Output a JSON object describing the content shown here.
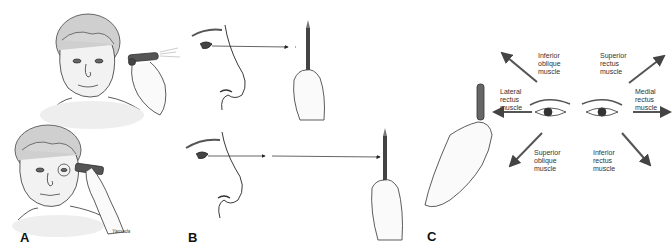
{
  "figure": {
    "panels": [
      {
        "id": "A",
        "letter": "A",
        "description": "Elderly woman with penlight held to eye (top) and occluder/penlight at eye with glasses (bottom)"
      },
      {
        "id": "B",
        "letter": "B",
        "description": "Profile views of face with sight-line arrows to a pencil held near (top) and far (bottom)"
      },
      {
        "id": "C",
        "letter": "C",
        "description": "Hand holding penlight; eyes with six cardinal direction arrows labeled by extraocular muscle"
      }
    ],
    "muscle_labels": {
      "inferior_oblique": "Inferior\noblique\nmuscle",
      "superior_rectus": "Superior\nrectus\nmuscle",
      "lateral_rectus": "Lateral\nrectus\nmuscle",
      "medial_rectus": "Medial\nrectus\nmuscle",
      "superior_oblique": "Superior\noblique\nmuscle",
      "inferior_rectus": "Inferior\nrectus\nmuscle"
    },
    "signature": "Yamada",
    "colors": {
      "line": "#222222",
      "shade": "#d8d8d8",
      "arrow": "#444444",
      "text": "#333333"
    }
  }
}
